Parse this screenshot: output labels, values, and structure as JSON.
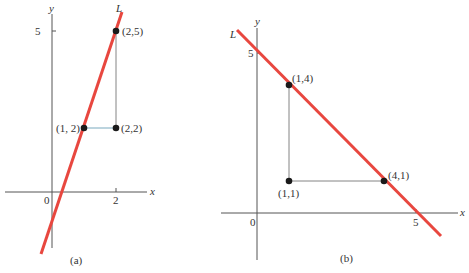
{
  "colors": {
    "line": "#e8473f",
    "axis": "#555555",
    "point": "#1a1a1a",
    "guide": "#777777",
    "guide_highlight": "#8fb7c9"
  },
  "panel_a": {
    "caption": "(a)",
    "line_label": "L",
    "x_axis_label": "x",
    "y_axis_label": "y",
    "origin_label": "0",
    "x_ticks": [
      {
        "value": 2,
        "label": "2"
      }
    ],
    "y_ticks": [
      {
        "value": 5,
        "label": "5"
      }
    ],
    "points": [
      {
        "x": 1,
        "y": 2,
        "label": "(1, 2)"
      },
      {
        "x": 2,
        "y": 2,
        "label": "(2,2)"
      },
      {
        "x": 2,
        "y": 5,
        "label": "(2,5)"
      }
    ],
    "line": {
      "slope": 3,
      "intercept": -1,
      "description": "Line L through (1,2) and (2,5)"
    }
  },
  "panel_b": {
    "caption": "(b)",
    "line_label": "L",
    "x_axis_label": "x",
    "y_axis_label": "y",
    "origin_label": "0",
    "x_ticks": [
      {
        "value": 5,
        "label": "5"
      }
    ],
    "y_ticks": [
      {
        "value": 5,
        "label": "5"
      }
    ],
    "points": [
      {
        "x": 1,
        "y": 4,
        "label": "(1,4)"
      },
      {
        "x": 1,
        "y": 1,
        "label": "(1,1)"
      },
      {
        "x": 4,
        "y": 1,
        "label": "(4,1)"
      }
    ],
    "line": {
      "slope": -1,
      "intercept": 5,
      "description": "Line L through (1,4) and (4,1)"
    }
  }
}
